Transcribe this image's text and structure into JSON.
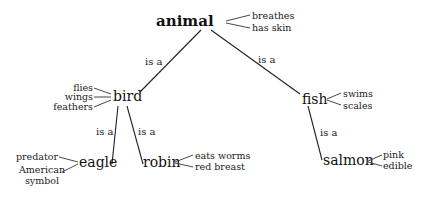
{
  "diagram": {
    "type": "semantic-network",
    "nodes": {
      "animal": {
        "label": "animal",
        "properties": [
          "breathes",
          "has skin"
        ]
      },
      "bird": {
        "label": "bird",
        "properties": [
          "flies",
          "wings",
          "feathers"
        ]
      },
      "fish": {
        "label": "fish",
        "properties": [
          "swims",
          "scales"
        ]
      },
      "eagle": {
        "label": "eagle",
        "properties": [
          "predator",
          "American",
          "symbol"
        ]
      },
      "robin": {
        "label": "robin",
        "properties": [
          "eats worms",
          "red breast"
        ]
      },
      "salmon": {
        "label": "salmon",
        "properties": [
          "pink",
          "edible"
        ]
      }
    },
    "edges": [
      {
        "from": "bird",
        "to": "animal",
        "label": "is a"
      },
      {
        "from": "fish",
        "to": "animal",
        "label": "is a"
      },
      {
        "from": "eagle",
        "to": "bird",
        "label": "is a"
      },
      {
        "from": "robin",
        "to": "bird",
        "label": "is a"
      },
      {
        "from": "salmon",
        "to": "fish",
        "label": "is a"
      }
    ]
  }
}
